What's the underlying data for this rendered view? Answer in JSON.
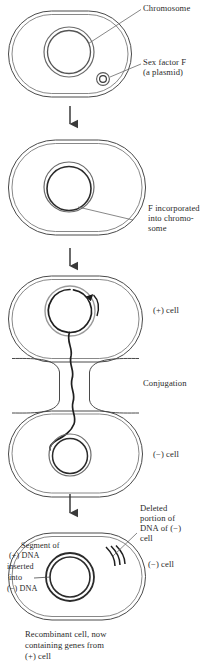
{
  "figure": {
    "background_color": "#ffffff",
    "line_color": "#333333",
    "dna_color": "#1a1a1a",
    "plasmid_color": "#8a8a8a",
    "text_color": "#2a2a2a"
  },
  "panels": [
    {
      "id": "panel-1",
      "name": "donor-cell-with-plasmid",
      "labels": [
        {
          "name": "chromosome-label",
          "text": "Chromosome"
        },
        {
          "name": "sex-factor-label-line1",
          "text": "Sex factor F"
        },
        {
          "name": "sex-factor-label-line2",
          "text": "(a plasmid)"
        }
      ]
    },
    {
      "id": "panel-2",
      "name": "f-integrated-cell",
      "labels": [
        {
          "name": "f-incorporated-line1",
          "text": "F incorporated"
        },
        {
          "name": "f-incorporated-line2",
          "text": "into chromo-"
        },
        {
          "name": "f-incorporated-line3",
          "text": "some"
        }
      ]
    },
    {
      "id": "panel-3",
      "name": "conjugating-cells",
      "labels": [
        {
          "name": "plus-cell-label",
          "text": "(+) cell"
        },
        {
          "name": "conjugation-label",
          "text": "Conjugation"
        },
        {
          "name": "minus-cell-label",
          "text": "(−) cell"
        }
      ]
    },
    {
      "id": "panel-4",
      "name": "recombinant-cell",
      "labels": [
        {
          "name": "deleted-portion-line1",
          "text": "Deleted"
        },
        {
          "name": "deleted-portion-line2",
          "text": "portion of"
        },
        {
          "name": "deleted-portion-line3",
          "text": "DNA of (−)"
        },
        {
          "name": "deleted-portion-line4",
          "text": "cell"
        },
        {
          "name": "minus-cell-label-2",
          "text": "(−) cell"
        },
        {
          "name": "segment-line1",
          "text": "Segment of"
        },
        {
          "name": "segment-line2",
          "text": "(+) DNA"
        },
        {
          "name": "segment-line3",
          "text": "inserted"
        },
        {
          "name": "segment-line4",
          "text": "into"
        },
        {
          "name": "segment-line5",
          "text": "(−) DNA"
        }
      ],
      "caption": [
        "Recombinant cell, now",
        "containing genes from",
        "(+) cell"
      ]
    }
  ],
  "flow_arrows": [
    {
      "name": "arrow-step-1-to-2"
    },
    {
      "name": "arrow-step-2-to-3"
    },
    {
      "name": "arrow-step-3-to-4"
    }
  ]
}
